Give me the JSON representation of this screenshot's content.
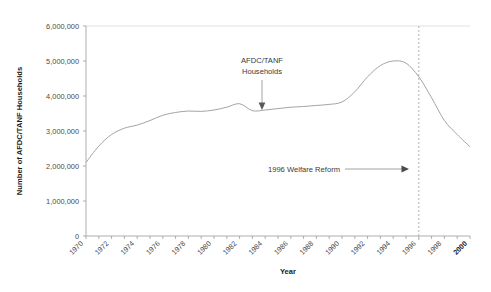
{
  "chart_data": {
    "type": "line",
    "title": "",
    "xlabel": "Year",
    "ylabel": "Number of AFDC/TANF Households",
    "xlim": [
      1970,
      2000
    ],
    "ylim": [
      0,
      6000000
    ],
    "grid": false,
    "legend_position": "none",
    "x": [
      1970,
      1971,
      1972,
      1973,
      1974,
      1975,
      1976,
      1977,
      1978,
      1979,
      1980,
      1981,
      1982,
      1983,
      1984,
      1985,
      1986,
      1987,
      1988,
      1989,
      1990,
      1991,
      1992,
      1993,
      1994,
      1995,
      1996,
      1997,
      1998,
      1999,
      2000
    ],
    "series": [
      {
        "name": "AFDC/TANF Households",
        "values": [
          2100000,
          2570000,
          2900000,
          3080000,
          3170000,
          3300000,
          3450000,
          3530000,
          3570000,
          3560000,
          3600000,
          3680000,
          3780000,
          3580000,
          3600000,
          3640000,
          3680000,
          3700000,
          3730000,
          3760000,
          3830000,
          4120000,
          4550000,
          4870000,
          5000000,
          4940000,
          4550000,
          3950000,
          3300000,
          2900000,
          2550000
        ]
      }
    ],
    "x_tick_labels": [
      "1970",
      "1972",
      "1974",
      "1976",
      "1978",
      "1980",
      "1982",
      "1984",
      "1986",
      "1988",
      "1990",
      "1992",
      "1994",
      "1996",
      "1998",
      "2000"
    ],
    "x_tick_values": [
      1970,
      1972,
      1974,
      1976,
      1978,
      1980,
      1982,
      1984,
      1986,
      1988,
      1990,
      1992,
      1994,
      1996,
      1998,
      2000
    ],
    "y_tick_labels": [
      "0",
      "1,000,000",
      "2,000,000",
      "3,000,000",
      "4,000,000",
      "5,000,000",
      "6,000,000"
    ],
    "y_tick_values": [
      0,
      1000000,
      2000000,
      3000000,
      4000000,
      5000000,
      6000000
    ],
    "annotations": [
      {
        "id": "series-callout",
        "text_line1": "AFDC/TANF",
        "text_line2": "Households",
        "arrow": "down",
        "target_x": 1986,
        "target_y": 3680000
      },
      {
        "id": "reform-callout",
        "text": "1996 Welfare Reform",
        "arrow": "right",
        "target_x": 1996,
        "target_y": 1800000
      }
    ],
    "reference_lines": [
      {
        "id": "welfare-reform-1996",
        "x": 1996,
        "style": "dashed",
        "color": "#b9b9b9"
      }
    ],
    "colors": {
      "series_line": "#9a9a9a",
      "axis": "#9a9a9a",
      "grid_top": "#d8d8d8",
      "reference_line": "#b9b9b9",
      "text": "#3a3a3a",
      "background": "#ffffff"
    }
  }
}
